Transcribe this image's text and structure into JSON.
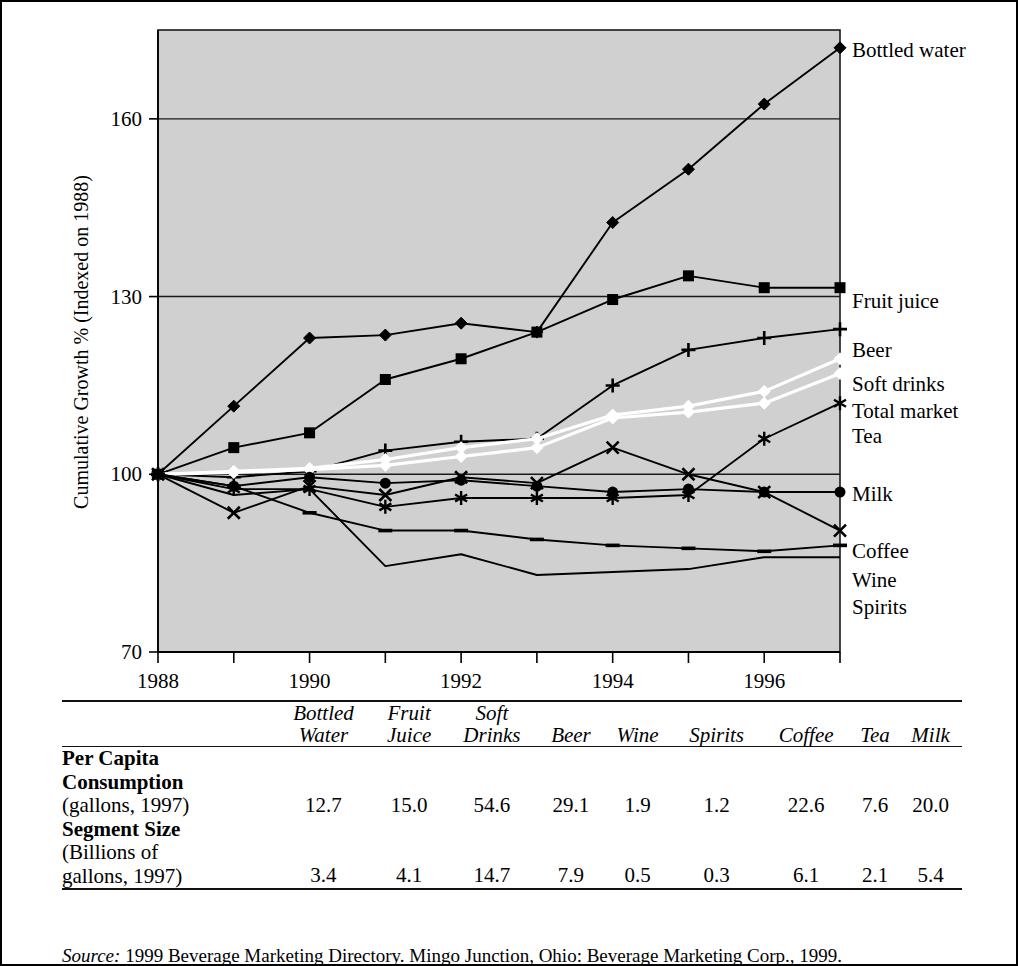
{
  "chart_data": {
    "type": "line",
    "title": "",
    "xlabel": "",
    "ylabel": "Cumulative Growth % (Indexed on 1988)",
    "x": [
      1988,
      1989,
      1990,
      1991,
      1992,
      1993,
      1994,
      1995,
      1996,
      1997
    ],
    "xticklabels": [
      "1988",
      "",
      "1990",
      "",
      "1992",
      "",
      "1994",
      "",
      "1996",
      ""
    ],
    "yticks": [
      70,
      100,
      130,
      160
    ],
    "yticklabels": [
      "70",
      "100",
      "130",
      "160"
    ],
    "ylim": [
      70,
      175
    ],
    "xlim": [
      1988,
      1997
    ],
    "grid": "horizontal",
    "legend_position": "right-of-axes-inline",
    "plot_background": "#d0d0d0",
    "series": [
      {
        "name": "Bottled water",
        "marker": "diamond",
        "color": "#000000",
        "values": [
          100.0,
          111.5,
          123.0,
          123.5,
          125.5,
          124.0,
          142.5,
          151.5,
          162.5,
          172.0
        ]
      },
      {
        "name": "Fruit juice",
        "marker": "square",
        "color": "#000000",
        "values": [
          100.0,
          104.5,
          107.0,
          116.0,
          119.5,
          124.0,
          129.5,
          133.5,
          131.5,
          131.5
        ]
      },
      {
        "name": "Beer",
        "marker": "plus",
        "color": "#000000",
        "values": [
          100.0,
          99.5,
          100.5,
          104.0,
          105.5,
          106.0,
          115.0,
          121.0,
          123.0,
          124.5
        ]
      },
      {
        "name": "Soft drinks",
        "marker": "white-diamond",
        "color": "#ffffff",
        "values": [
          100.0,
          100.5,
          101.0,
          102.5,
          104.5,
          106.0,
          110.0,
          111.5,
          114.0,
          119.5
        ]
      },
      {
        "name": "Total market",
        "marker": "white-diamond",
        "color": "#ffffff",
        "values": [
          100.0,
          100.3,
          100.8,
          101.5,
          103.0,
          104.5,
          109.5,
          110.5,
          112.0,
          117.0
        ]
      },
      {
        "name": "Tea",
        "marker": "asterisk",
        "color": "#000000",
        "values": [
          100.0,
          97.5,
          97.5,
          94.5,
          96.0,
          96.0,
          96.0,
          96.5,
          106.0,
          112.0
        ]
      },
      {
        "name": "Milk",
        "marker": "circle",
        "color": "#000000",
        "values": [
          100.0,
          98.0,
          99.5,
          98.5,
          99.0,
          98.0,
          97.0,
          97.5,
          97.0,
          97.0
        ]
      },
      {
        "name": "Coffee",
        "marker": "x",
        "color": "#000000",
        "values": [
          100.0,
          93.5,
          98.0,
          96.5,
          99.5,
          98.5,
          104.5,
          100.0,
          97.0,
          90.5
        ]
      },
      {
        "name": "Wine",
        "marker": "dash",
        "color": "#000000",
        "values": [
          100.0,
          98.0,
          93.5,
          90.5,
          90.5,
          89.0,
          88.0,
          87.5,
          87.0,
          88.0
        ]
      },
      {
        "name": "Spirits",
        "marker": "none",
        "color": "#000000",
        "values": [
          100.0,
          96.5,
          97.5,
          84.5,
          86.5,
          83.0,
          83.5,
          84.0,
          86.0,
          86.0
        ]
      }
    ]
  },
  "table": {
    "columns": [
      {
        "line1": "Bottled",
        "line2": "Water"
      },
      {
        "line1": "Fruit",
        "line2": "Juice"
      },
      {
        "line1": "Soft",
        "line2": "Drinks"
      },
      {
        "line1": "",
        "line2": "Beer"
      },
      {
        "line1": "",
        "line2": "Wine"
      },
      {
        "line1": "",
        "line2": "Spirits"
      },
      {
        "line1": "",
        "line2": "Coffee"
      },
      {
        "line1": "",
        "line2": "Tea"
      },
      {
        "line1": "",
        "line2": "Milk"
      }
    ],
    "rows": [
      {
        "label_bold_1": "Per Capita",
        "label_bold_2": "Consumption",
        "label_plain": "(gallons, 1997)",
        "values": [
          "12.7",
          "15.0",
          "54.6",
          "29.1",
          "1.9",
          "1.2",
          "22.6",
          "7.6",
          "20.0"
        ]
      },
      {
        "label_bold_1": "Segment Size",
        "label_bold_2": "",
        "label_plain_1": "(Billions of",
        "label_plain": "gallons, 1997)",
        "values": [
          "3.4",
          "4.1",
          "14.7",
          "7.9",
          "0.5",
          "0.3",
          "6.1",
          "2.1",
          "5.4"
        ]
      }
    ]
  },
  "source": {
    "prefix": "Source:",
    "text": " 1999 Beverage Marketing Directory. Mingo Junction, Ohio: Beverage Marketing Corp., 1999."
  }
}
